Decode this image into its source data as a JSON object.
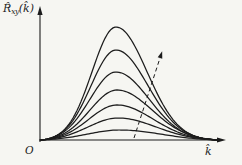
{
  "figure": {
    "background": "#f6f6f2",
    "line_color": "#1c1c1c"
  },
  "labels": {
    "y_axis_base": "R̂",
    "y_axis_sub": "xy",
    "y_axis_arg": "(k̂)",
    "y_axis_full": "R̂xy(k̂)",
    "x_axis": "k̂",
    "origin": "O"
  },
  "chart_data": {
    "type": "line",
    "title": "",
    "xlabel": "k̂",
    "ylabel": "R̂xy(k̂)",
    "origin_label": "O",
    "axes": {
      "grid": false,
      "baseline_y_px": 140,
      "x_start_px": 40,
      "x_end_px": 226,
      "y_top_px": 6,
      "curve_end_x_px": 219
    },
    "series": [
      {
        "name": "curve-1-tallest",
        "peak_height_norm": 1.0,
        "peak_x_px": 116,
        "height_px": 113,
        "sigma_left_px": 24,
        "sigma_right_px": 31
      },
      {
        "name": "curve-2",
        "peak_height_norm": 0.8,
        "peak_x_px": 116,
        "height_px": 90,
        "sigma_left_px": 25,
        "sigma_right_px": 32
      },
      {
        "name": "curve-3",
        "peak_height_norm": 0.6,
        "peak_x_px": 116,
        "height_px": 68,
        "sigma_left_px": 26,
        "sigma_right_px": 33
      },
      {
        "name": "curve-4",
        "peak_height_norm": 0.44,
        "peak_x_px": 117,
        "height_px": 50,
        "sigma_left_px": 27,
        "sigma_right_px": 35
      },
      {
        "name": "curve-5",
        "peak_height_norm": 0.31,
        "peak_x_px": 117,
        "height_px": 35,
        "sigma_left_px": 28,
        "sigma_right_px": 36
      },
      {
        "name": "curve-6",
        "peak_height_norm": 0.19,
        "peak_x_px": 118,
        "height_px": 22,
        "sigma_left_px": 30,
        "sigma_right_px": 38
      },
      {
        "name": "curve-7-lowest",
        "peak_height_norm": 0.09,
        "peak_x_px": 120,
        "height_px": 10,
        "sigma_left_px": 33,
        "sigma_right_px": 41
      }
    ],
    "annotation": {
      "type": "dashed-arrow",
      "meaning": "direction of increasing curve peak height",
      "from_px": [
        134,
        138
      ],
      "to_px": [
        160,
        58
      ]
    }
  }
}
